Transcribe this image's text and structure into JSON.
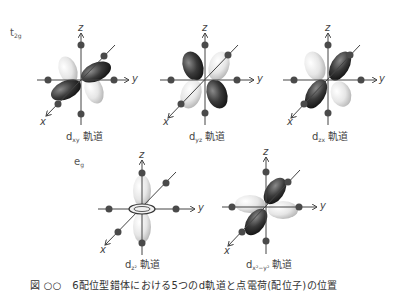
{
  "groups": {
    "t2g": {
      "main": "t",
      "sub": "2g"
    },
    "eg": {
      "main": "e",
      "sub": "g"
    }
  },
  "orbitals": [
    {
      "id": "dxy",
      "prefix": "d",
      "sub": "xy",
      "suffix": " 軌道"
    },
    {
      "id": "dyz",
      "prefix": "d",
      "sub": "yz",
      "suffix": " 軌道"
    },
    {
      "id": "dzx",
      "prefix": "d",
      "sub": "zx",
      "suffix": " 軌道"
    },
    {
      "id": "dz2",
      "prefix": "d",
      "sub": "z²",
      "suffix": " 軌道"
    },
    {
      "id": "dx2y2",
      "prefix": "d",
      "sub": "x²−y²",
      "suffix": " 軌道"
    }
  ],
  "axes": {
    "x": "x",
    "y": "y",
    "z": "z"
  },
  "caption": "図 ○○　6配位型錯体における5つのd軌道と点電荷(配位子)の位置",
  "colors": {
    "dark_lobe": "#3a3a3a",
    "light_lobe": "#e6e6e6",
    "ligand": "#4a4a4a",
    "axis": "#444444"
  }
}
